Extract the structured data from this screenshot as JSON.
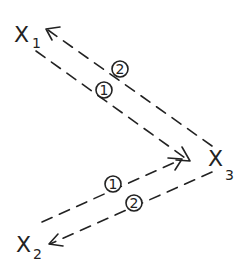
{
  "diagram": {
    "type": "message-flow",
    "nodes": [
      {
        "id": "X1",
        "label": "X",
        "subscript": "1"
      },
      {
        "id": "X2",
        "label": "X",
        "subscript": "2"
      },
      {
        "id": "X3",
        "label": "X",
        "subscript": "3"
      }
    ],
    "edges": [
      {
        "from": "X1",
        "to": "X3",
        "label": "1",
        "style": "dashed"
      },
      {
        "from": "X3",
        "to": "X1",
        "label": "2",
        "style": "dashed"
      },
      {
        "from": "X2",
        "to": "X3",
        "label": "1",
        "style": "dashed"
      },
      {
        "from": "X3",
        "to": "X2",
        "label": "2",
        "style": "dashed"
      }
    ]
  },
  "colors": {
    "ink": "#222222",
    "background": "#ffffff"
  }
}
